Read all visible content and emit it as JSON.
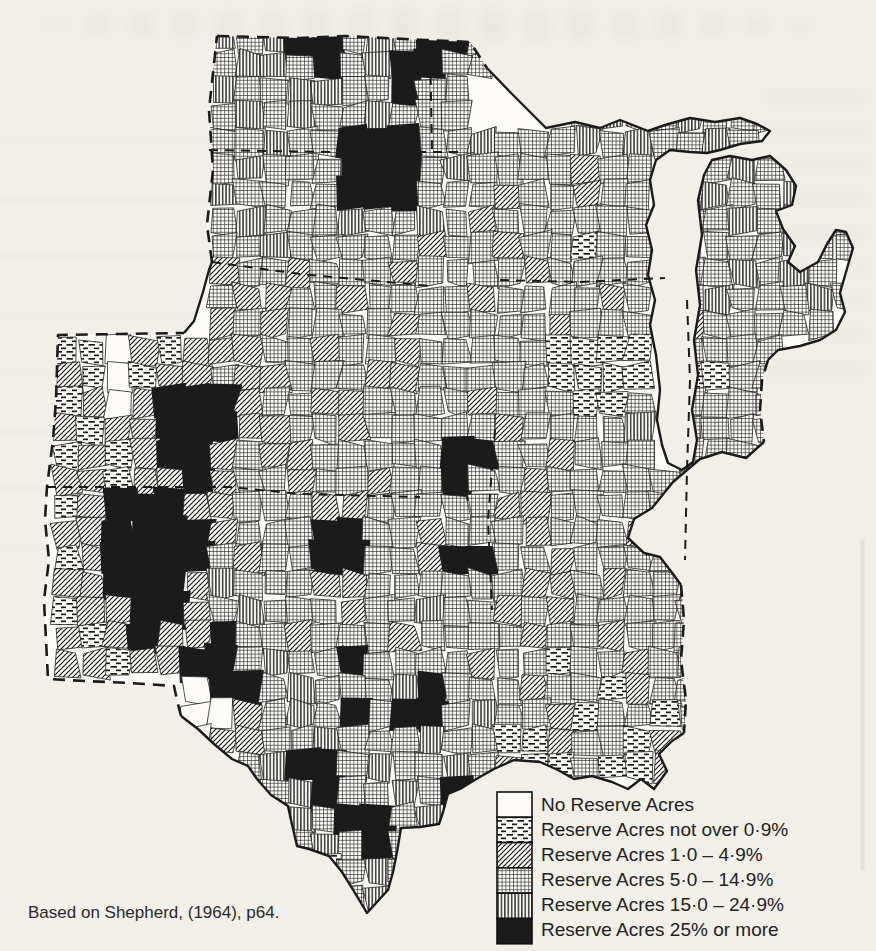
{
  "page": {
    "background": "#f1efe8",
    "ink": "#1b1b1b"
  },
  "caption": {
    "text": "Based on Shepherd, (1964), p64."
  },
  "legend": {
    "items": [
      {
        "label": "No Reserve Acres",
        "key": "W"
      },
      {
        "label": "Reserve Acres not over 0·9%",
        "key": "H"
      },
      {
        "label": "Reserve Acres 1·0 – 4·9%",
        "key": "D"
      },
      {
        "label": "Reserve Acres 5·0 – 14·9%",
        "key": "C"
      },
      {
        "label": "Reserve Acres 15·0 – 24·9%",
        "key": "V"
      },
      {
        "label": "Reserve Acres 25% or more",
        "key": "B"
      }
    ]
  },
  "map": {
    "fill": "#fcfbf7",
    "ink": "#1b1b1b",
    "cell_stroke": "#242424",
    "classes": {
      "W": "#fcfbf7",
      "H": "url(#pat-h)",
      "D": "url(#pat-d)",
      "C": "url(#pat-c)",
      "V": "url(#pat-v)",
      "B": "#1b1b1b"
    },
    "outline": "217,36 300,38 345,36 425,40 470,42 487,68 510,92 528,110 546,128 575,122 600,128 620,120 648,131 665,125 690,118 715,122 740,118 757,124 770,131 762,141 740,144 720,150 707,153 690,152 670,150 656,160 650,180 654,205 646,225 652,250 648,275 655,300 650,325 656,355 660,390 657,420 662,445 668,463 682,470 693,462 697,440 692,410 698,375 694,340 700,305 696,270 702,235 698,200 704,175 712,160 730,156 752,160 770,156 786,170 796,186 792,205 776,211 783,229 795,246 788,262 800,272 818,262 827,244 836,230 846,232 853,248 846,272 840,293 845,312 836,330 820,340 800,346 778,350 768,360 762,380 760,410 764,442 746,458 722,452 700,459 673,482 652,508 634,519 628,538 644,553 660,557 673,574 681,585 684,620 681,660 686,700 684,733 672,741 659,754 667,771 654,789 641,779 628,789 612,782 592,776 574,779 558,770 540,762 514,760 494,769 478,778 460,789 448,794 443,812 439,824 420,827 401,828 397,852 393,872 388,890 377,902 367,913 355,893 342,872 329,856 309,849 297,846 291,820 288,806 271,795 257,779 248,766 232,759 214,744 198,729 181,716 177,700 174,686 130,683 85,681 48,679 46,640 44,600 49,560 45,520 47,487 53,440 56,400 58,335 120,334 184,333 194,321 203,292 209,270 212,262 207,225 213,170 209,110",
    "border_dashed": [
      "M217,36 L300,38 345,36 425,40 470,42 487,68",
      "M768,360 L762,380 760,410 764,442",
      "M681,585 L684,620 681,660 686,700 684,733",
      "M181,716 L177,700 174,686 130,683 85,681 48,679 46,640 44,600 49,560 45,520 47,487 53,440 56,400 58,335 120,334 184,333",
      "M212,262 L207,225 213,170 209,110 217,36"
    ],
    "border_solid": [
      "M487,68 L510,92 528,110 546,128 575,122 600,128 620,120 648,131 665,125 690,118 715,122 740,118 757,124 770,131 762,141 740,144 720,150 707,153 690,152 670,150 656,160 650,180 654,205 646,225 652,250 648,275 655,300 650,325 656,355 660,390 657,420 662,445 668,463 682,470 693,462 697,440 692,410 698,375 694,340 700,305 696,270 702,235 698,200 704,175 712,160 730,156 752,160 770,156 786,170 796,186 792,205 776,211 783,229 795,246 788,262 800,272 818,262 827,244 836,230 846,232 853,248 846,272 840,293 845,312 836,330 820,340 800,346 778,350 768,360",
      "M764,442 L746,458 722,452 700,459 673,482 652,508 634,519 628,538 644,553 660,557 673,574 681,585",
      "M684,733 L672,741 659,754 667,771 654,789 641,779 628,789 612,782 592,776 574,779 558,770 540,762 514,760 494,769 478,778 460,789 448,794 443,812 439,824 420,827 401,828 397,852 393,872 388,890 377,902 367,913 355,893 342,872 329,856 309,849 297,846 291,820 288,806 271,795 257,779 248,766 232,759 214,744 198,729 181,716",
      "M184,333 L194,321 203,292 209,270 212,262"
    ],
    "state_lines": [
      "M209,150 L330,152 462,152",
      "M430,44 L432,150",
      "M212,262 L300,274 430,286",
      "M47,487 L230,487 300,494 420,497",
      "M500,280 L580,282 665,278",
      "M687,300 L690,380 687,470 685,560",
      "M495,430 L488,520 492,610"
    ],
    "grid": {
      "x0": 28,
      "y0": 26,
      "cell": 26,
      "rows": [
        ".......VCVBBCVCBBC",
        ".......CVVCBCVBBCC",
        ".......VCCVVCCBCC",
        ".......CVCVCCVCCC....CVCCVCCC",
        ".......CCVCCBBBCCVCCCVCVCCVC",
        ".......CVCCCBBBCVCCCCDCC.CCVC",
        ".......VCCCCBBBCCCDCCDCC.CVCCV",
        ".......CVCCCVCCVCDCCCCCC.CCVCCVC",
        ".......CCVCCCCCDCCDCCHCC.VCCCVCC",
        ".......DCCDCCCDCCCCDCCCC.CCVCVC",
        ".......CDDCCDCCCCDCCCCDC.CVCCCVC",
        ".......DCDCCCCDCCCCCDCCC.DCCCCC",
        ".HHWDHDDDCCDCCDCCCCCHHHH.CCCC",
        ".DHWHDDCDDCCCDDCCCCCHHHH.HHCC",
        ".HDWDBBBDCCDDCCCCDCCCHHC.CCCC",
        ".DHDDBBBDDCCDCCCCCDCCCCV.CCCC",
        ".HDHDBBDCDDCCCCCBBCCDCCC.CCC",
        ".DDHDDBDCCDCCDCCBCCDCCCCCCC",
        ".HDBBBDDCCCDDCCCCCDDCCCCCC",
        ".DDBBBBDCCCBBCCDCCCDCCCD",
        ".HDBBBBCDCCBBCCDBBCCDCCCCC",
        ".DDBBBDVCCCDDCCCCCCDDCDCCC",
        ".HDDBBDCVCCCDCCVCCDCDCCCCC",
        ".DHDBDDBCCDCCCDCCCCDCCDCCC",
        ".DDHDDBBCVCCBCCCCDCCHCCDCC",
        "......WBBCVCCCVBCCCDCCHDCC",
        "......WWDCVCBCBBCVCCDHCCHC",
        "......WDDCCVCCCVCCHHDCCHD",
        "........CVBBCVCCVCDHHCHHD",
        ".........CVBCCVCB",
        "..........VCBBCV",
        "..........CVCBC",
        "...........HCVC",
        "............CV"
      ]
    }
  }
}
